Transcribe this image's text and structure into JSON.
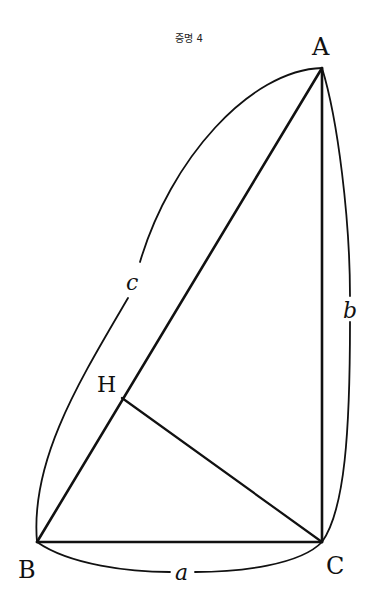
{
  "title": "증명 4",
  "points": {
    "A": {
      "label": "A",
      "x": 322,
      "y": 68
    },
    "B": {
      "label": "B",
      "x": 37,
      "y": 542
    },
    "C": {
      "label": "C",
      "x": 322,
      "y": 542
    },
    "H": {
      "label": "H",
      "x": 122,
      "y": 398
    }
  },
  "sides": {
    "a": {
      "label": "a"
    },
    "b": {
      "label": "b"
    },
    "c": {
      "label": "c"
    }
  }
}
